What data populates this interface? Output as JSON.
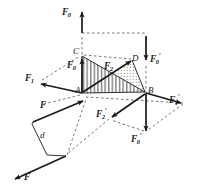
{
  "figure": {
    "background_color": "#ffffff",
    "line_color": "#1a1a1a",
    "hatch_color": "#2b2b2b",
    "dash_color": "#555555",
    "width": 197,
    "height": 192
  },
  "points": [
    {
      "id": "A",
      "label": "A",
      "x": 82,
      "y": 93
    },
    {
      "id": "B",
      "label": "B",
      "x": 146,
      "y": 93
    },
    {
      "id": "C",
      "label": "C",
      "x": 80,
      "y": 53
    },
    {
      "id": "D",
      "label": "D",
      "x": 133,
      "y": 60
    }
  ],
  "vectors": [
    {
      "id": "F0-top",
      "label": "F",
      "sub": "0",
      "prime": "",
      "direction": "up",
      "tail": [
        82,
        33
      ],
      "head": [
        82,
        10
      ]
    },
    {
      "id": "F0-up-A",
      "label": "F",
      "sub": "0",
      "prime": "",
      "direction": "up",
      "tail": [
        82,
        93
      ],
      "head": [
        82,
        57
      ]
    },
    {
      "id": "F0-prime-right",
      "label": "F",
      "sub": "0",
      "prime": "'",
      "direction": "down",
      "tail": [
        146,
        33
      ],
      "head": [
        146,
        62
      ]
    },
    {
      "id": "F0-prime-bottom",
      "label": "F",
      "sub": "0",
      "prime": "'",
      "direction": "down",
      "tail": [
        146,
        93
      ],
      "head": [
        146,
        131
      ]
    },
    {
      "id": "F1",
      "label": "F",
      "sub": "1",
      "prime": "",
      "direction": "left",
      "tail": [
        82,
        93
      ],
      "head": [
        40,
        83
      ]
    },
    {
      "id": "F1-prime",
      "label": "F",
      "sub": "1",
      "prime": "'",
      "direction": "right",
      "tail": [
        146,
        93
      ],
      "head": [
        182,
        103
      ]
    },
    {
      "id": "F2",
      "label": "F",
      "sub": "2",
      "prime": "",
      "direction": "up-right",
      "tail": [
        82,
        93
      ],
      "head": [
        132,
        61
      ]
    },
    {
      "id": "F2-prime",
      "label": "F",
      "sub": "2",
      "prime": "'",
      "direction": "down-left",
      "tail": [
        146,
        93
      ],
      "head": [
        111,
        117
      ]
    },
    {
      "id": "F",
      "label": "F",
      "sub": "",
      "prime": "",
      "direction": "up-right",
      "tail": [
        32,
        122
      ],
      "head": [
        84,
        100
      ]
    },
    {
      "id": "F-prime",
      "label": "F",
      "sub": "",
      "prime": "'",
      "direction": "down-left",
      "tail": [
        66,
        156
      ],
      "head": [
        14,
        180
      ]
    }
  ],
  "labels": {
    "F0": {
      "base": "F",
      "sub": "0",
      "prime": ""
    },
    "F0_prime": {
      "base": "F",
      "sub": "0",
      "prime": "'"
    },
    "F1": {
      "base": "F",
      "sub": "1",
      "prime": ""
    },
    "F1_prime": {
      "base": "F",
      "sub": "1",
      "prime": "'"
    },
    "F2": {
      "base": "F",
      "sub": "2",
      "prime": ""
    },
    "F2_prime": {
      "base": "F",
      "sub": "2",
      "prime": "'"
    },
    "F": {
      "base": "F",
      "sub": "",
      "prime": ""
    },
    "F_prime": {
      "base": "F",
      "sub": "",
      "prime": "'"
    },
    "d": "d",
    "A": "A",
    "B": "B",
    "C": "C",
    "D": "D"
  },
  "regions": [
    {
      "id": "triangle-ACB",
      "fill": "hatch-vertical",
      "description": "vertically hatched triangle A-C-B"
    },
    {
      "id": "triangle-DB",
      "fill": "dotted",
      "description": "stippled triangle near D-B"
    }
  ],
  "moment_arm": {
    "label": "d",
    "x": 42,
    "y": 136
  }
}
